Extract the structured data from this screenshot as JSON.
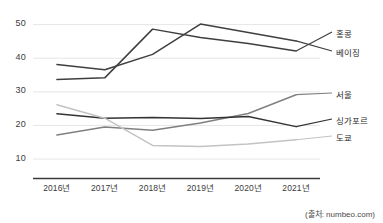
{
  "chart_data": {
    "type": "line",
    "title": "",
    "xlabel": "",
    "ylabel": "",
    "categories": [
      "2016년",
      "2017년",
      "2018년",
      "2019년",
      "2020년",
      "2021년"
    ],
    "ytick_labels": [
      "50",
      "40",
      "30",
      "20",
      "10"
    ],
    "ytick_values": [
      50,
      40,
      30,
      20,
      10
    ],
    "ylim": [
      6,
      53
    ],
    "grid": true,
    "grid_axis": "y",
    "legend_position": "right-inline-labels",
    "series": [
      {
        "name": "홍콩",
        "values": [
          33.5,
          34.0,
          48.5,
          46.0,
          44.2,
          42.0
        ],
        "color": "#3f3f3f",
        "label_x": 336,
        "label_y": 27
      },
      {
        "name": "베이징",
        "values": [
          38.0,
          36.4,
          41.0,
          50.0,
          47.5,
          45.0
        ],
        "color": "#3f3f3f",
        "label_x": 336,
        "label_y": 46
      },
      {
        "name": "서울",
        "values": [
          17.0,
          19.4,
          18.4,
          20.6,
          23.4,
          29.0
        ],
        "color": "#808080",
        "label_x": 336,
        "label_y": 88
      },
      {
        "name": "싱가포르",
        "values": [
          23.3,
          22.0,
          22.2,
          21.9,
          22.5,
          19.5
        ],
        "color": "#333333",
        "label_x": 336,
        "label_y": 114
      },
      {
        "name": "도쿄",
        "values": [
          26.0,
          22.0,
          13.9,
          13.6,
          14.3,
          15.6
        ],
        "color": "#c3c3c3",
        "label_x": 336,
        "label_y": 131
      }
    ],
    "source": "(출처: numbeo.com)"
  }
}
